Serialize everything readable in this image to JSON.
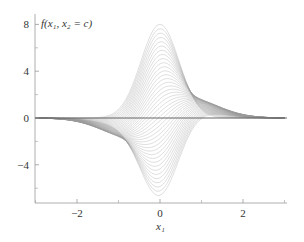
{
  "chart_data": {
    "type": "line",
    "title": "f(x₁, x₂ = c)",
    "xlabel": "x₁",
    "ylabel": "",
    "xlim": [
      -3,
      3
    ],
    "ylim": [
      -7,
      8.5
    ],
    "x_ticks": [
      -2,
      0,
      2
    ],
    "x_minor_ticks": [
      -3,
      -1,
      1,
      3
    ],
    "y_ticks": [
      -4,
      0,
      4,
      8
    ],
    "y_minor_ticks": [
      -6,
      -2,
      2,
      6
    ],
    "grid": false,
    "legend": null,
    "series_summary": {
      "count": 40,
      "max_peak": {
        "x": 0,
        "y": 8
      },
      "min_trough": {
        "x": 0.1,
        "y": -6.6
      },
      "side_hump": {
        "x": 1.3,
        "y": 3.2
      },
      "side_trough": {
        "x": -1.3,
        "y": -3.0
      }
    },
    "line_color": "#9a9a9a"
  }
}
